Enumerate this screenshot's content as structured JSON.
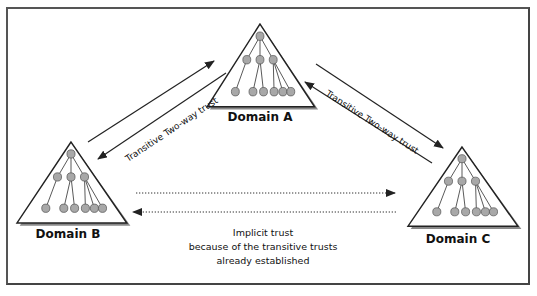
{
  "diagram": {
    "domains": [
      {
        "id": "A",
        "label": "Domain A"
      },
      {
        "id": "B",
        "label": "Domain B"
      },
      {
        "id": "C",
        "label": "Domain C"
      }
    ],
    "trusts": [
      {
        "between": [
          "A",
          "B"
        ],
        "label": "Transitive Two-way trust",
        "style": "solid",
        "direction": "bidirectional"
      },
      {
        "between": [
          "A",
          "C"
        ],
        "label": "Transitive Two-way trust",
        "style": "solid",
        "direction": "bidirectional"
      },
      {
        "between": [
          "B",
          "C"
        ],
        "label": "Implicit trust",
        "style": "dotted",
        "direction": "bidirectional"
      }
    ],
    "implicit_note": {
      "line1": "Implicit trust",
      "line2": "because of the transitive trusts",
      "line3": "already established"
    },
    "colors": {
      "line": "#222222",
      "node_fill": "#a8a8a8",
      "node_stroke": "#555555",
      "triangle_shadow": "#888888"
    }
  }
}
